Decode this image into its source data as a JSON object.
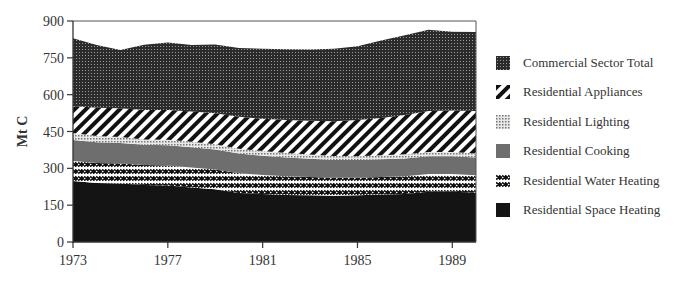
{
  "chart_data": {
    "type": "area",
    "stacked": true,
    "title": "",
    "xlabel": "",
    "ylabel": "Mt C",
    "ylim": [
      0,
      900
    ],
    "yticks": [
      0,
      150,
      300,
      450,
      600,
      750,
      900
    ],
    "xticks": [
      1973,
      1977,
      1981,
      1985,
      1989
    ],
    "xlim": [
      1973,
      1990
    ],
    "grid": false,
    "legend_position": "right",
    "x": [
      1973,
      1974,
      1975,
      1976,
      1977,
      1978,
      1979,
      1980,
      1981,
      1982,
      1983,
      1984,
      1985,
      1986,
      1987,
      1988,
      1989,
      1990
    ],
    "series": [
      {
        "name": "Residential Space Heating",
        "pattern": "solid-black",
        "color": "#141414",
        "values": [
          248,
          240,
          238,
          232,
          230,
          222,
          215,
          200,
          195,
          192,
          190,
          188,
          190,
          193,
          196,
          205,
          205,
          202
        ]
      },
      {
        "name": "Residential Water Heating",
        "pattern": "zigzag",
        "color": "#ffffff",
        "values": [
          82,
          82,
          82,
          82,
          82,
          82,
          80,
          80,
          78,
          76,
          75,
          74,
          72,
          72,
          72,
          72,
          72,
          70
        ]
      },
      {
        "name": "Residential Cooking",
        "pattern": "solid-gray",
        "color": "#6e6e6e",
        "values": [
          85,
          84,
          83,
          82,
          82,
          82,
          82,
          80,
          78,
          76,
          74,
          72,
          72,
          72,
          72,
          72,
          72,
          72
        ]
      },
      {
        "name": "Residential Lighting",
        "pattern": "fine-dots",
        "color": "#bbbbbb",
        "values": [
          29,
          26,
          24,
          22,
          22,
          22,
          21,
          20,
          19,
          18,
          17,
          16,
          15,
          16,
          17,
          17,
          17,
          17
        ]
      },
      {
        "name": "Residential Appliances",
        "pattern": "diagonal-stripes",
        "color": "#111111",
        "values": [
          110,
          115,
          118,
          120,
          122,
          124,
          126,
          130,
          132,
          135,
          138,
          142,
          148,
          152,
          160,
          168,
          170,
          172
        ]
      },
      {
        "name": "Commercial Sector Total",
        "pattern": "dense-dots",
        "color": "#3a3a3a",
        "values": [
          276,
          255,
          237,
          265,
          275,
          270,
          280,
          280,
          285,
          288,
          290,
          295,
          300,
          315,
          325,
          330,
          320,
          322
        ]
      }
    ],
    "totals": [
      830,
      802,
      782,
      803,
      813,
      802,
      804,
      790,
      787,
      785,
      784,
      787,
      797,
      820,
      842,
      864,
      856,
      855
    ]
  },
  "legend": {
    "items": [
      {
        "label": "Commercial Sector Total",
        "pattern": "dense-dots"
      },
      {
        "label": "Residential Appliances",
        "pattern": "diagonal-stripes"
      },
      {
        "label": "Residential Lighting",
        "pattern": "fine-dots"
      },
      {
        "label": "Residential Cooking",
        "pattern": "solid-gray"
      },
      {
        "label": "Residential Water Heating",
        "pattern": "zigzag"
      },
      {
        "label": "Residential Space Heating",
        "pattern": "solid-black"
      }
    ]
  },
  "axis": {
    "ylabel": "Mt C",
    "ytick_labels": [
      "0",
      "150",
      "300",
      "450",
      "600",
      "750",
      "900"
    ],
    "xtick_labels": [
      "1973",
      "1977",
      "1981",
      "1985",
      "1989"
    ]
  }
}
